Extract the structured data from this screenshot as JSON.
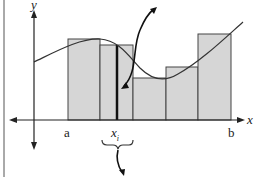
{
  "diagram": {
    "type": "riemann-sum-illustration",
    "labels": {
      "y_axis": "y",
      "x_axis": "x",
      "left_endpoint": "a",
      "right_endpoint": "b",
      "sample_point": "x",
      "sample_point_sub": "i"
    },
    "colors": {
      "bar_fill": "#d6d6d6",
      "bar_stroke": "#444444",
      "axis": "#222222",
      "curve": "#333333",
      "background": "#ffffff"
    },
    "bars": [
      {
        "x0": 68,
        "x1": 100,
        "top": 39
      },
      {
        "x0": 100,
        "x1": 133,
        "top": 45
      },
      {
        "x0": 133,
        "x1": 166,
        "top": 78
      },
      {
        "x0": 166,
        "x1": 198,
        "top": 67
      },
      {
        "x0": 198,
        "x1": 231,
        "top": 34
      }
    ],
    "highlighted_sample_line_x": 117
  }
}
